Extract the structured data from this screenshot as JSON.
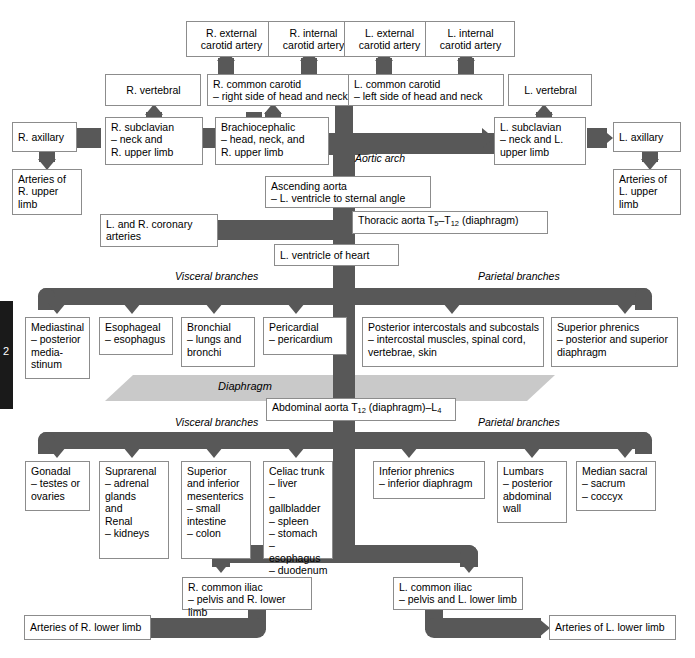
{
  "diagram": {
    "page_marker": "2",
    "colors": {
      "vessel": "#585858",
      "box_border": "#8c8c8c",
      "box_fill": "#ffffff",
      "diaphragm": "#c9c9c9",
      "tab": "#1a1a1a"
    },
    "section_labels": {
      "aortic_arch": "Aortic arch",
      "thoracic_visceral": "Visceral branches",
      "thoracic_parietal": "Parietal branches",
      "diaphragm": "Diaphragm",
      "abdominal_visceral": "Visceral branches",
      "abdominal_parietal": "Parietal branches"
    },
    "nodes": {
      "r_external_carotid": "R. external\ncarotid artery",
      "r_internal_carotid": "R. internal\ncarotid artery",
      "l_external_carotid": "L. external\ncarotid artery",
      "l_internal_carotid": "L. internal\ncarotid artery",
      "r_vertebral": "R. vertebral",
      "l_vertebral": "L. vertebral",
      "r_common_carotid": "R. common carotid\n– right side of head and neck",
      "l_common_carotid": "L. common carotid\n– left side of head and neck",
      "r_axillary": "R. axillary",
      "l_axillary": "L. axillary",
      "r_subclavian": "R. subclavian\n– neck and\n   R. upper limb",
      "l_subclavian": "L. subclavian\n– neck and L.\n   upper limb",
      "brachiocephalic": "Brachiocephalic\n– head, neck, and\n   R. upper limb",
      "arteries_r_upper": "Arteries of\nR. upper\nlimb",
      "arteries_l_upper": "Arteries of\nL. upper\nlimb",
      "ascending_aorta": "Ascending aorta\n– L. ventricle to sternal angle",
      "coronary": "L. and R. coronary\narteries",
      "l_ventricle": "L. ventricle of heart",
      "thoracic_aorta_pre": "Thoracic aorta T",
      "thoracic_aorta_sub1": "5",
      "thoracic_aorta_mid": "–T",
      "thoracic_aorta_sub2": "12",
      "thoracic_aorta_post": " (diaphragm)",
      "abdominal_aorta_pre": "Abdominal aorta T",
      "abdominal_aorta_sub1": "12",
      "abdominal_aorta_mid": " (diaphragm)–L",
      "abdominal_aorta_sub2": "4",
      "mediastinal": "Mediastinal\n– posterior\n   media-\n   stinum",
      "esophageal": "Esophageal\n– esophagus",
      "bronchial": "Bronchial\n– lungs and\n   bronchi",
      "pericardial": "Pericardial\n– pericardium",
      "post_intercostals": "Posterior intercostals and subcostals\n– intercostal muscles, spinal cord,\n   vertebrae, skin",
      "superior_phrenics": "Superior phrenics\n– posterior and superior\n   diaphragm",
      "gonadal": "Gonadal\n– testes or\n   ovaries",
      "suprarenal": "Suprarenal\n– adrenal\n   glands\n   and\nRenal\n– kidneys",
      "mesenterics": "Superior\nand inferior\nmesenterics\n– small\n   intestine\n– colon",
      "celiac": "Celiac trunk\n– liver\n– gallbladder\n– spleen\n– stomach\n– esophagus\n– duodenum",
      "inferior_phrenics": "Inferior phrenics\n– inferior diaphragm",
      "lumbars": "Lumbars\n– posterior\n   abdominal\n   wall",
      "median_sacral": "Median sacral\n– sacrum\n– coccyx",
      "r_common_iliac": "R. common iliac\n– pelvis and R. lower limb",
      "l_common_iliac": "L. common iliac\n– pelvis and L. lower limb",
      "arteries_r_lower": "Arteries of R. lower limb",
      "arteries_l_lower": "Arteries of L. lower limb"
    }
  }
}
